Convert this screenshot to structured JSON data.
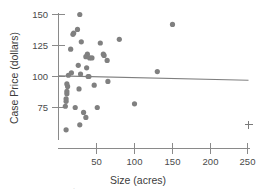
{
  "chart_data": {
    "type": "scatter",
    "title": "",
    "xlabel": "Size (acres)",
    "ylabel": "Case Price (dollars)",
    "xlim": [
      0,
      258
    ],
    "ylim": [
      55,
      156
    ],
    "grid": false,
    "legend": null,
    "x_ticks": [
      50,
      100,
      150,
      200,
      250
    ],
    "x_tick_labels": [
      "50",
      "100",
      "150",
      "200",
      "250"
    ],
    "y_ticks": [
      75,
      100,
      125,
      150
    ],
    "y_tick_labels": [
      "75",
      "100",
      "125",
      "150"
    ],
    "marker": "filled-circle",
    "marker_color": "#808080",
    "points": [
      {
        "x": 28,
        "y": 150
      },
      {
        "x": 25,
        "y": 138
      },
      {
        "x": 20,
        "y": 135
      },
      {
        "x": 19,
        "y": 134
      },
      {
        "x": 150,
        "y": 142
      },
      {
        "x": 80,
        "y": 130
      },
      {
        "x": 30,
        "y": 128
      },
      {
        "x": 55,
        "y": 127
      },
      {
        "x": 16,
        "y": 122
      },
      {
        "x": 38,
        "y": 118
      },
      {
        "x": 59,
        "y": 118
      },
      {
        "x": 60,
        "y": 117
      },
      {
        "x": 36,
        "y": 116
      },
      {
        "x": 41,
        "y": 115
      },
      {
        "x": 44,
        "y": 115
      },
      {
        "x": 64,
        "y": 113
      },
      {
        "x": 26,
        "y": 109
      },
      {
        "x": 37,
        "y": 107
      },
      {
        "x": 130,
        "y": 104
      },
      {
        "x": 17,
        "y": 103
      },
      {
        "x": 29,
        "y": 102
      },
      {
        "x": 13,
        "y": 101
      },
      {
        "x": 39,
        "y": 100
      },
      {
        "x": 40,
        "y": 100
      },
      {
        "x": 65,
        "y": 96
      },
      {
        "x": 11,
        "y": 94
      },
      {
        "x": 12,
        "y": 92
      },
      {
        "x": 27,
        "y": 90
      },
      {
        "x": 47,
        "y": 93
      },
      {
        "x": 11,
        "y": 88
      },
      {
        "x": 11,
        "y": 86
      },
      {
        "x": 10,
        "y": 82
      },
      {
        "x": 10,
        "y": 80
      },
      {
        "x": 100,
        "y": 78
      },
      {
        "x": 9,
        "y": 76
      },
      {
        "x": 22,
        "y": 75
      },
      {
        "x": 51,
        "y": 75
      },
      {
        "x": 33,
        "y": 71
      },
      {
        "x": 36,
        "y": 67
      },
      {
        "x": 28,
        "y": 61
      },
      {
        "x": 10,
        "y": 57
      }
    ],
    "outlier_marker": {
      "symbol": "plus",
      "x": 250,
      "y": 61
    },
    "trend_line": {
      "type": "linear-fit",
      "x_start": 0,
      "y_start": 100.5,
      "x_end": 250,
      "y_end": 97.0
    }
  }
}
